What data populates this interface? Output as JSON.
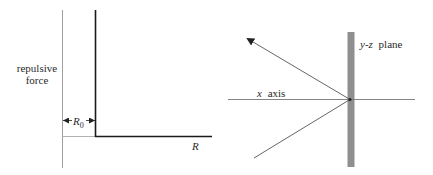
{
  "left_panel": {
    "y_label_line1": "repulsive",
    "y_label_line2": "force",
    "x_label": "R",
    "r0_label": "R",
    "r0_subscript": "0",
    "colors": {
      "axis": "#9a9a9a",
      "curve": "#1a1a1a"
    }
  },
  "right_panel": {
    "plane_label_italic": "y-z",
    "plane_label_rest": "plane",
    "axis_label_italic": "x",
    "axis_label_rest": "axis",
    "colors": {
      "plane": "#8f8f8f",
      "lines": "#555555"
    }
  }
}
